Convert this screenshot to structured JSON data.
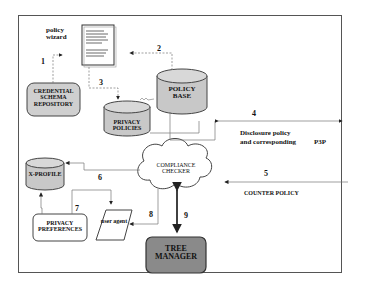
{
  "diagram": {
    "nodes": {
      "policy_wizard": "policy wizard",
      "credential_schema_repository": "CREDENTIAL SCHEMA REPOSITORY",
      "policy_base": "POLICY BASE",
      "privacy_policies": "PRIVACY POLICIES",
      "x_profile": "X-PROFILE",
      "compliance_checker": "COMPLIANCE CHECKER",
      "privacy_preferences": "PRIVACY PREFERENCES",
      "user_agent": "user agent",
      "tree_manager": "TREE MANAGER"
    },
    "labels": {
      "disclosure_line1": "Disclosure policy",
      "disclosure_line2": "and corresponding",
      "p3p": "P3P",
      "counter_policy": "COUNTER POLICY"
    },
    "edges": [
      "1",
      "2",
      "3",
      "4",
      "5",
      "6",
      "7",
      "8",
      "9"
    ],
    "colors": {
      "cylinder_fill": "#c8c8c8",
      "repo_fill": "#cfcfcf",
      "tree_manager_fill": "#8a8a8a",
      "line": "#333333"
    }
  }
}
